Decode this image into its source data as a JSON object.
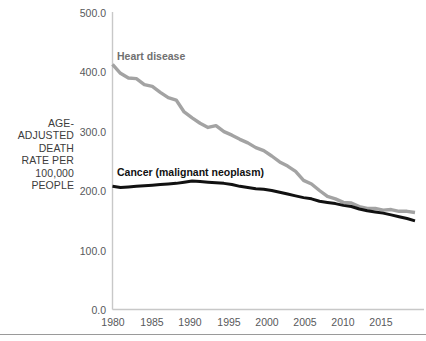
{
  "chart_data": {
    "type": "line",
    "title": "",
    "subtitle": "",
    "xlabel": "",
    "ylabel": "AGE-\nADJUSTED\nDEATH\nRATE PER\n100,000\nPEOPLE",
    "ylabel_lines": [
      "AGE-",
      "ADJUSTED",
      "DEATH",
      "RATE PER",
      "100,000",
      "PEOPLE"
    ],
    "ylim": [
      0,
      500
    ],
    "xlim": [
      1980,
      2018
    ],
    "grid": false,
    "legend_position": "inline-annotations",
    "ytick_labels": [
      "500.0",
      "400.0",
      "300.0",
      "200.0",
      "100.0",
      "0.0"
    ],
    "ytick_values": [
      500,
      400,
      300,
      200,
      100,
      0
    ],
    "xtick_labels": [
      "1980",
      "1985",
      "1990",
      "1995",
      "2000",
      "2005",
      "2010",
      "2015"
    ],
    "xtick_values": [
      1980,
      1985,
      1990,
      1995,
      2000,
      2005,
      2010,
      2015
    ],
    "x": [
      1980,
      1981,
      1982,
      1983,
      1984,
      1985,
      1986,
      1987,
      1988,
      1989,
      1990,
      1991,
      1992,
      1993,
      1994,
      1995,
      1996,
      1997,
      1998,
      1999,
      2000,
      2001,
      2002,
      2003,
      2004,
      2005,
      2006,
      2007,
      2008,
      2009,
      2010,
      2011,
      2012,
      2013,
      2014,
      2015,
      2016,
      2017,
      2018
    ],
    "series": [
      {
        "name": "Heart disease",
        "color": "#a3a3a3",
        "label_color": "#707070",
        "label_x": 1981,
        "label_y": 432,
        "values": [
          412,
          397,
          389,
          388,
          378,
          375,
          365,
          356,
          352,
          332,
          322,
          313,
          306,
          309,
          299,
          293,
          286,
          280,
          272,
          267,
          258,
          248,
          241,
          232,
          217,
          211,
          200,
          190,
          186,
          180,
          179,
          173,
          170,
          170,
          167,
          168,
          165,
          165,
          163
        ]
      },
      {
        "name": "Cancer (malignant neoplasm)",
        "color": "#111111",
        "label_color": "#111111",
        "label_x": 1981,
        "label_y": 238,
        "values": [
          207,
          205,
          206,
          207,
          208,
          209,
          210,
          211,
          212,
          214,
          216,
          215,
          214,
          213,
          212,
          210,
          207,
          205,
          203,
          202,
          200,
          197,
          194,
          191,
          188,
          186,
          182,
          180,
          178,
          175,
          173,
          169,
          166,
          164,
          162,
          159,
          156,
          153,
          149
        ]
      }
    ],
    "annotations": [
      {
        "text": "Heart disease",
        "name": "heart-disease-label"
      },
      {
        "text": "Cancer (malignant neoplasm)",
        "name": "cancer-label"
      }
    ]
  }
}
